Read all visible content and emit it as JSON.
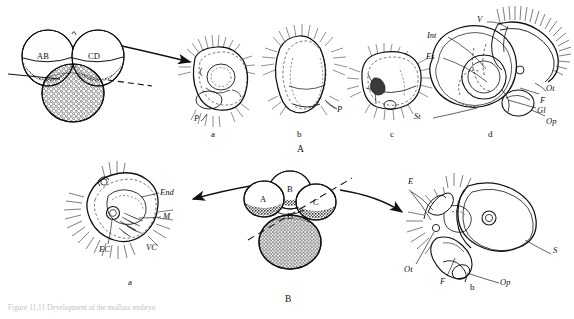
{
  "figure": {
    "caption": "Figure 11.11  Development of the mollusc embryo",
    "panels": [
      {
        "id": "A",
        "panel_label": "A",
        "stage_labels": [
          "a",
          "b",
          "c",
          "d"
        ],
        "blastomere_labels": [
          "AB",
          "CD"
        ],
        "trochophore_label": "P",
        "anatomy_labels": [
          "V",
          "Int",
          "Es",
          "St",
          "Ot",
          "F",
          "Gl",
          "Op"
        ]
      },
      {
        "id": "B",
        "panel_label": "B",
        "stage_labels": [
          "a",
          "b"
        ],
        "blastomere_labels": [
          "A",
          "B",
          "C",
          "D"
        ],
        "larva_left_labels": [
          "End",
          "M",
          "EC",
          "VC"
        ],
        "larva_right_labels": [
          "E",
          "S",
          "Ot",
          "F",
          "Op"
        ]
      }
    ]
  },
  "panelA": {
    "blastomere_AB": "AB",
    "blastomere_CD": "CD",
    "stage_a": "a",
    "stage_b": "b",
    "stage_c": "c",
    "stage_d": "d",
    "proto_a": "P",
    "proto_b": "P",
    "label_V": "V",
    "label_Int": "Int",
    "label_Es": "Es",
    "label_St": "St",
    "label_Ot": "Ot",
    "label_F": "F",
    "label_Gl": "Gl",
    "label_Op": "Op",
    "panel_label": "A"
  },
  "panelB": {
    "cell_A": "A",
    "cell_B": "B",
    "cell_C": "C",
    "cell_D": "D",
    "stage_a": "a",
    "stage_b": "b",
    "label_End": "End",
    "label_M": "M",
    "label_EC": "EC",
    "label_VC": "VC",
    "label_E": "E",
    "label_S": "S",
    "label_Ot": "Ot",
    "label_F": "F",
    "label_Op": "Op",
    "panel_label": "B"
  },
  "colors": {
    "ink": "#1a1a1a",
    "page": "#ffffff",
    "stipple": "#3a3a3a",
    "faint": "#9a9a9a"
  }
}
